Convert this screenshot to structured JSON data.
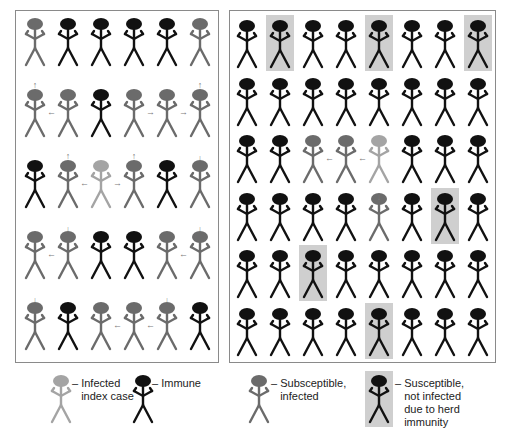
{
  "colors": {
    "immune": "#111111",
    "infected": "#6b6b6b",
    "index": "#a4a4a4",
    "shade": "#cfcfcf",
    "arrow": "#7a7a7a"
  },
  "left_panel": {
    "rows": [
      [
        "infected",
        "immune",
        "immune",
        "immune",
        "immune",
        "infected"
      ],
      [
        "infected",
        "infected",
        "immune",
        "infected",
        "infected",
        "infected"
      ],
      [
        "immune",
        "infected",
        "index",
        "infected",
        "immune",
        "infected"
      ],
      [
        "infected",
        "infected",
        "immune",
        "immune",
        "infected",
        "infected"
      ],
      [
        "infected",
        "immune",
        "infected",
        "infected",
        "infected",
        "immune"
      ]
    ],
    "arrows": [
      {
        "row": 0.5,
        "col": 0,
        "dir": "up"
      },
      {
        "row": 0.5,
        "col": 5,
        "dir": "up"
      },
      {
        "row": 1,
        "col": 0.5,
        "dir": "left"
      },
      {
        "row": 1,
        "col": 3.5,
        "dir": "right"
      },
      {
        "row": 1,
        "col": 4.5,
        "dir": "right"
      },
      {
        "row": 1.5,
        "col": 1,
        "dir": "up"
      },
      {
        "row": 1.5,
        "col": 3,
        "dir": "up"
      },
      {
        "row": 1.5,
        "col": 5,
        "dir": "down"
      },
      {
        "row": 2,
        "col": 1.5,
        "dir": "left"
      },
      {
        "row": 2,
        "col": 2.5,
        "dir": "right"
      },
      {
        "row": 2.5,
        "col": 1,
        "dir": "down"
      },
      {
        "row": 2.5,
        "col": 5,
        "dir": "down"
      },
      {
        "row": 3,
        "col": 0.5,
        "dir": "left"
      },
      {
        "row": 3,
        "col": 4.5,
        "dir": "left"
      },
      {
        "row": 3.5,
        "col": 0,
        "dir": "down"
      },
      {
        "row": 3.5,
        "col": 4,
        "dir": "down"
      },
      {
        "row": 4,
        "col": 2.5,
        "dir": "left"
      },
      {
        "row": 4,
        "col": 3.5,
        "dir": "left"
      }
    ]
  },
  "right_panel": {
    "rows": [
      [
        "immune",
        "shaded",
        "immune",
        "immune",
        "shaded",
        "immune",
        "immune",
        "shaded"
      ],
      [
        "immune",
        "immune",
        "immune",
        "immune",
        "immune",
        "immune",
        "immune",
        "immune"
      ],
      [
        "immune",
        "immune",
        "infected",
        "infected",
        "index",
        "immune",
        "immune",
        "immune"
      ],
      [
        "immune",
        "immune",
        "immune",
        "immune",
        "infected",
        "immune",
        "shaded",
        "immune"
      ],
      [
        "immune",
        "immune",
        "shaded",
        "immune",
        "immune",
        "immune",
        "immune",
        "immune"
      ],
      [
        "immune",
        "immune",
        "immune",
        "immune",
        "shaded",
        "immune",
        "immune",
        "immune"
      ]
    ],
    "arrows": [
      {
        "row": 2,
        "col": 2.5,
        "dir": "left"
      },
      {
        "row": 2,
        "col": 3.5,
        "dir": "left"
      },
      {
        "row": 2.5,
        "col": 4,
        "dir": "down"
      }
    ]
  },
  "legend": {
    "items": [
      {
        "type": "index",
        "label": "– Infected\n   index case"
      },
      {
        "type": "immune",
        "label": "– Immune"
      },
      {
        "type": "infected",
        "label": "– Subsceptible,\n   infected"
      },
      {
        "type": "shaded",
        "label": "– Susceptible,\n   not infected\n   due to herd\n   immunity"
      }
    ]
  },
  "arrow_glyphs": {
    "up": "↑",
    "down": "↓",
    "left": "←",
    "right": "→"
  }
}
